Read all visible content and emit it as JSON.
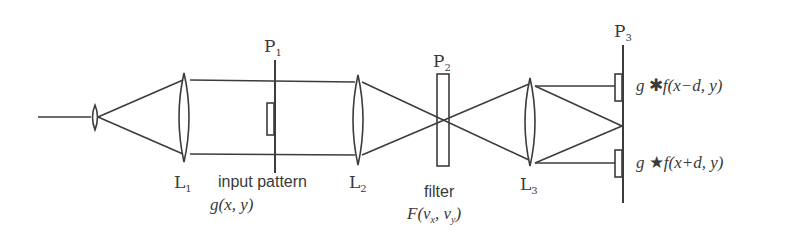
{
  "diagram": {
    "colors": {
      "stroke": "#3c3c3c",
      "text": "#3a3a3a",
      "background": "#ffffff"
    },
    "planes": [
      {
        "id": "P1",
        "letter": "P",
        "sub": "1",
        "caption": "input pattern",
        "function": "g(x, y)"
      },
      {
        "id": "P2",
        "letter": "P",
        "sub": "2",
        "caption": "filter",
        "function_main": "F(ν",
        "function_sub1": "x",
        "function_mid": ", ν",
        "function_sub2": "y",
        "function_end": ")"
      },
      {
        "id": "P3",
        "letter": "P",
        "sub": "3"
      }
    ],
    "lenses": [
      {
        "id": "L1",
        "letter": "L",
        "sub": "1"
      },
      {
        "id": "L2",
        "letter": "L",
        "sub": "2"
      },
      {
        "id": "L3",
        "letter": "L",
        "sub": "3"
      }
    ],
    "outputs": [
      {
        "g": "g",
        "op": "✱",
        "rest": "f(x−d, y)",
        "operation": "convolution"
      },
      {
        "g": "g",
        "op": "★",
        "rest": "f(x+d, y)",
        "operation": "correlation"
      }
    ]
  }
}
